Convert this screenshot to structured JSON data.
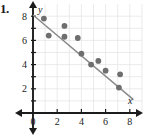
{
  "problem": {
    "number": "1."
  },
  "chart_data": {
    "type": "scatter",
    "title": "",
    "xlabel": "x",
    "ylabel": "y",
    "xlim": [
      0,
      9
    ],
    "ylim": [
      0,
      8.8
    ],
    "grid": true,
    "legend": false,
    "xticks": [
      0,
      2,
      4,
      6,
      8
    ],
    "xtick_labels": [
      "0",
      "2",
      "4",
      "6",
      "8"
    ],
    "yticks": [
      2,
      4,
      6,
      8
    ],
    "ytick_labels": [
      "2",
      "4",
      "6",
      "8"
    ],
    "x": [
      0.9,
      1.3,
      2.6,
      2.6,
      3.7,
      4.0,
      4.8,
      5.4,
      6.0,
      7.2,
      7.1
    ],
    "y": [
      7.8,
      6.4,
      7.2,
      6.3,
      6.2,
      4.9,
      4.0,
      4.3,
      3.5,
      3.2,
      2.1
    ],
    "points": [
      {
        "x": 0.9,
        "y": 7.8
      },
      {
        "x": 1.3,
        "y": 6.4
      },
      {
        "x": 2.6,
        "y": 7.2
      },
      {
        "x": 2.6,
        "y": 6.3
      },
      {
        "x": 3.7,
        "y": 6.2
      },
      {
        "x": 4.0,
        "y": 4.9
      },
      {
        "x": 4.8,
        "y": 4.0
      },
      {
        "x": 5.4,
        "y": 4.3
      },
      {
        "x": 6.0,
        "y": 3.5
      },
      {
        "x": 7.2,
        "y": 3.2
      },
      {
        "x": 7.1,
        "y": 2.1
      }
    ],
    "trend_line": {
      "label": "line of best fit",
      "x_start": 0.0,
      "y_start": 8.1,
      "x_end": 8.3,
      "y_end": 1.1,
      "slope": -0.84,
      "intercept": 8.1
    },
    "colors": {
      "point": "#6e6e6e",
      "trend": "#8a8a8a",
      "axis": "#1c1c1c",
      "grid": "#e3e3e3",
      "text": "#1a1a1a",
      "background": "#ffffff"
    }
  }
}
